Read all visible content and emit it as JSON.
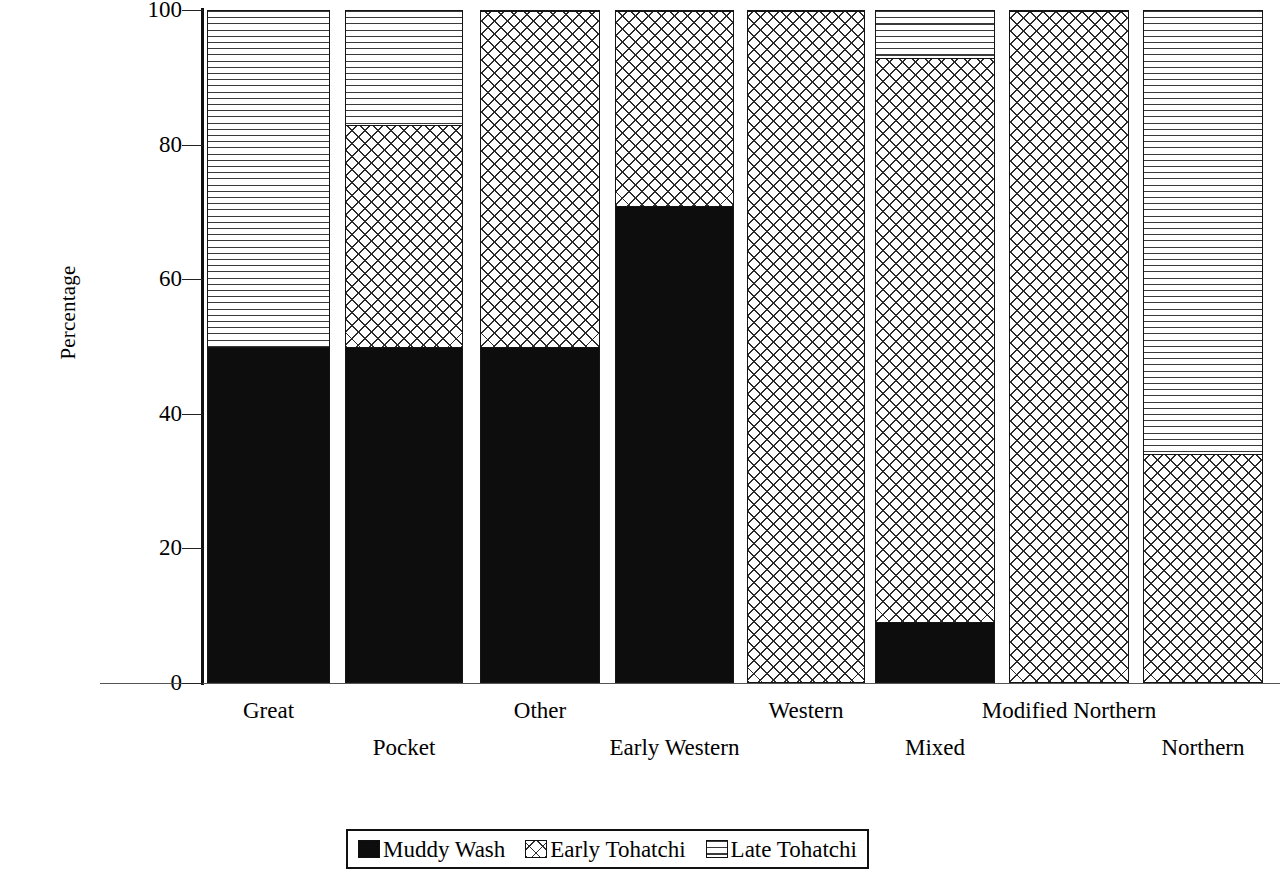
{
  "chart_data": {
    "type": "bar",
    "subtype": "stacked-bar-100-percent",
    "title": "",
    "xlabel": "",
    "ylabel": "Percentage",
    "ylim": [
      0,
      100
    ],
    "yticks": [
      0,
      20,
      40,
      60,
      80,
      100
    ],
    "ytick_labels": [
      "0",
      "20",
      "40",
      "60",
      "80",
      "100"
    ],
    "grid": false,
    "legend_position": "bottom-center",
    "categories": [
      "Great",
      "Pocket",
      "Other",
      "Early Western",
      "Western",
      "Mixed",
      "Modified Northern",
      "Northern"
    ],
    "series": [
      {
        "name": "Muddy Wash",
        "pattern": "solid-black",
        "color": "#0d0d0d",
        "values": [
          50,
          50,
          50,
          71,
          0,
          9,
          0,
          0
        ]
      },
      {
        "name": "Early Tohatchi",
        "pattern": "cross-hatch",
        "color": "#ffffff",
        "values": [
          0,
          33,
          50,
          29,
          100,
          84,
          100,
          34
        ]
      },
      {
        "name": "Late Tohatchi",
        "pattern": "horizontal-lines",
        "color": "#ffffff",
        "values": [
          50,
          17,
          0,
          0,
          0,
          7,
          0,
          66
        ]
      }
    ]
  },
  "axis": {
    "y_title": "Percentage"
  },
  "legend": {
    "entries": [
      {
        "label": "Muddy Wash",
        "pattern": "solid-black"
      },
      {
        "label": "Early Tohatchi",
        "pattern": "cross-hatch"
      },
      {
        "label": "Late Tohatchi",
        "pattern": "horizontal-lines"
      }
    ]
  }
}
